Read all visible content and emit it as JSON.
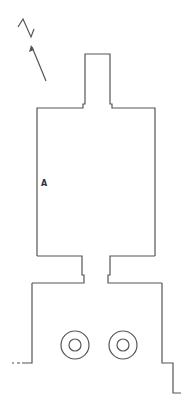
{
  "diagram": {
    "type": "architectural-floor-plan",
    "north_label": "N",
    "room_label": "A",
    "colors": {
      "line": "#555555",
      "background": "#ffffff"
    },
    "elements": {
      "north_arrow": {
        "letter": "N",
        "direction": "up-left"
      },
      "tower": {
        "x": 85,
        "y": 54,
        "width": 25
      },
      "main_hall": {
        "x": 37,
        "y": 108,
        "width": 118,
        "height": 148,
        "label": "A"
      },
      "neck": {
        "x": 82,
        "y": 256,
        "width": 28
      },
      "lower_hall": {
        "x": 32,
        "y": 283,
        "width": 130
      },
      "columns": [
        {
          "cx": 75,
          "cy": 345,
          "outer_r": 14,
          "inner_r": 6
        },
        {
          "cx": 123,
          "cy": 345,
          "outer_r": 14,
          "inner_r": 6
        }
      ]
    }
  }
}
